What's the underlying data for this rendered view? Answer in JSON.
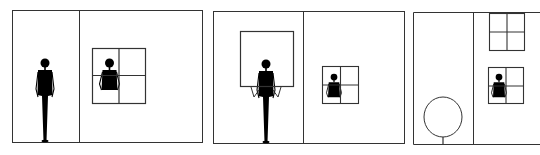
{
  "figure": {
    "stroke_color": "#333333",
    "fill_color": "#000000",
    "background": "#ffffff",
    "panels": [
      {
        "id": 1,
        "label": "Person standing in room next to wall with window showing a figure"
      },
      {
        "id": 2,
        "label": "Person holding a large window frame; smaller window with figure on other wall"
      },
      {
        "id": 3,
        "label": "Tree on left; building wall with upper empty window and lower window with figure"
      }
    ]
  }
}
